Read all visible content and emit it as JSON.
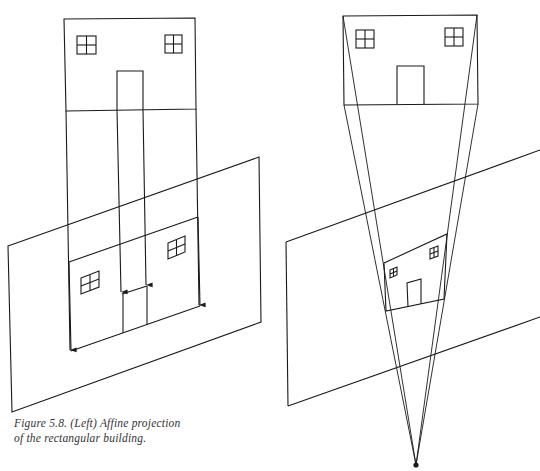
{
  "figure": {
    "caption_line1": "Figure 5.8. (Left) Affine projection",
    "caption_line2": "of the rectangular building.",
    "left_panel": {
      "title": "Affine projection",
      "elements": [
        "building-facade",
        "two-windows",
        "door",
        "parallel-projection-rays-with-arrows",
        "image-plane",
        "projected-facade"
      ]
    },
    "right_panel": {
      "title": "Perspective projection",
      "elements": [
        "building-facade",
        "two-windows",
        "door",
        "converging-rays",
        "image-plane",
        "projected-facade",
        "center-of-projection"
      ]
    },
    "colors": {
      "line": "#1a1a1a",
      "background": "#ffffff",
      "caption": "#333333"
    }
  }
}
